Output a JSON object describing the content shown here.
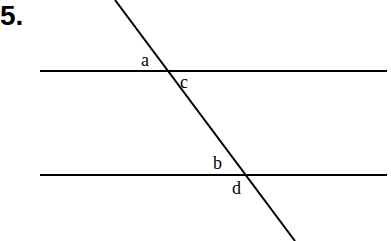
{
  "problem": {
    "number": "5."
  },
  "diagram": {
    "lines": {
      "parallel_top": {
        "x1": 40,
        "y1": 71,
        "x2": 387,
        "y2": 71
      },
      "parallel_bottom": {
        "x1": 40,
        "y1": 175,
        "x2": 387,
        "y2": 175
      },
      "transversal": {
        "x1": 115,
        "y1": 0,
        "x2": 295,
        "y2": 241
      }
    },
    "angle_labels": {
      "a": "a",
      "c": "c",
      "b": "b",
      "d": "d"
    },
    "colors": {
      "stroke": "#000000",
      "background": "#ffffff"
    }
  }
}
